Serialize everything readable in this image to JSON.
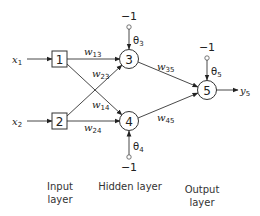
{
  "diagram": {
    "type": "neural-network",
    "inputs": [
      {
        "id": "x1",
        "label": "x",
        "subscript": "1",
        "node": "1"
      },
      {
        "id": "x2",
        "label": "x",
        "subscript": "2",
        "node": "2"
      }
    ],
    "nodes": {
      "n1": "1",
      "n2": "2",
      "n3": "3",
      "n4": "4",
      "n5": "5"
    },
    "weights": {
      "w13": {
        "base": "w",
        "sub": "13"
      },
      "w23": {
        "base": "w",
        "sub": "23"
      },
      "w14": {
        "base": "w",
        "sub": "14"
      },
      "w24": {
        "base": "w",
        "sub": "24"
      },
      "w35": {
        "base": "w",
        "sub": "35"
      },
      "w45": {
        "base": "w",
        "sub": "45"
      }
    },
    "biases": {
      "b3": {
        "input": "−1",
        "theta": "θ",
        "sub": "3"
      },
      "b4": {
        "input": "−1",
        "theta": "θ",
        "sub": "4"
      },
      "b5": {
        "input": "−1",
        "theta": "θ",
        "sub": "5"
      }
    },
    "output": {
      "label": "y",
      "subscript": "5"
    },
    "layers": {
      "input": "Input\nlayer",
      "input_line1": "Input",
      "input_line2": "layer",
      "hidden": "Hidden layer",
      "output_line1": "Output",
      "output_line2": "layer"
    }
  }
}
